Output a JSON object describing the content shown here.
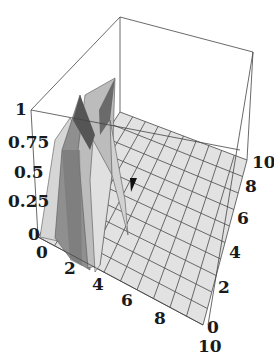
{
  "chart_data": {
    "type": "surface3d",
    "title": "",
    "xlabel": "",
    "ylabel": "",
    "zlabel": "",
    "x_ticks": [
      "0",
      "2",
      "4",
      "6",
      "8",
      "10"
    ],
    "y_ticks": [
      "0",
      "2",
      "4",
      "6",
      "8",
      "10"
    ],
    "z_ticks": [
      "0",
      "0.25",
      "0.5",
      "0.75",
      "1"
    ],
    "z_tick_display": [
      "0",
      "0.25",
      "0.5",
      "0.75",
      "1"
    ],
    "xlim": [
      0,
      10
    ],
    "ylim": [
      0,
      10
    ],
    "zlim": [
      0,
      1
    ],
    "box": true,
    "grid_mesh": "10x10",
    "surface_description": "Surface is ~0 across the domain except a sharp double-ridge peak near x=1..3, y=0..2 reaching z≈1",
    "peak": {
      "x": 2,
      "y": 1,
      "z": 1
    },
    "colors": {
      "surface_light": "#e2e2e2",
      "surface_mid": "#b9b9b9",
      "surface_dark": "#7a7a7a",
      "ridge_dark": "#555555",
      "edges": "#444444"
    }
  },
  "labels": {
    "z": [
      "0",
      "0.25",
      "0.5",
      "0.75",
      "1"
    ],
    "x": [
      "0",
      "2",
      "4",
      "6",
      "8",
      "10"
    ],
    "y": [
      "0",
      "2",
      "4",
      "6",
      "8",
      "10"
    ]
  }
}
